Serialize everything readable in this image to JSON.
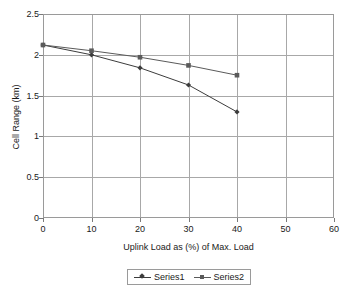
{
  "chart_data": {
    "type": "line",
    "title": "",
    "xlabel": "Uplink Load as (%) of Max. Load",
    "ylabel": "Cell Range (km)",
    "xlim": [
      0,
      60
    ],
    "ylim": [
      0,
      2.5
    ],
    "xticks": [
      0,
      10,
      20,
      30,
      40,
      50,
      60
    ],
    "yticks": [
      0,
      0.5,
      1,
      1.5,
      2,
      2.5
    ],
    "xtick_labels": [
      "0",
      "10",
      "20",
      "30",
      "40",
      "50",
      "60"
    ],
    "ytick_labels": [
      "0",
      "0.5",
      "1",
      "1.5",
      "2",
      "2.5"
    ],
    "grid": true,
    "legend_position": "bottom",
    "x": [
      0,
      10,
      20,
      30,
      40
    ],
    "series": [
      {
        "name": "Series1",
        "marker": "diamond",
        "color": "#3c3c3c",
        "values": [
          2.12,
          2.0,
          1.84,
          1.63,
          1.3
        ]
      },
      {
        "name": "Series2",
        "marker": "square",
        "color": "#5a5a5a",
        "values": [
          2.12,
          2.05,
          1.97,
          1.87,
          1.75
        ]
      }
    ]
  },
  "legend": {
    "entries": [
      {
        "label": "Series1"
      },
      {
        "label": "Series2"
      }
    ]
  },
  "colors": {
    "axis": "#9a9a9a",
    "grid": "#a8a8a8",
    "text": "#1a1a1a",
    "series1": "#3c3c3c",
    "series2": "#5a5a5a",
    "background": "#ffffff"
  }
}
